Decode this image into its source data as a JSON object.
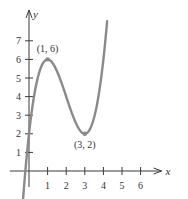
{
  "chart_data": {
    "type": "line",
    "title": "",
    "xlabel": "x",
    "ylabel": "y",
    "function": "y = x^3 - 6x^2 + 9x + 2",
    "xlim": [
      -0.6,
      6.7
    ],
    "ylim": [
      -0.8,
      7.7
    ],
    "x_ticks": [
      1,
      2,
      3,
      4,
      5,
      6
    ],
    "y_ticks": [
      1,
      2,
      3,
      4,
      5,
      6,
      7
    ],
    "x_tick_labels": [
      "1",
      "2",
      "3",
      "4",
      "5",
      "6"
    ],
    "y_tick_labels": [
      "1",
      "2",
      "3",
      "4",
      "5",
      "6",
      "7"
    ],
    "grid": false,
    "series": [
      {
        "name": "f(x)",
        "color": "#8a8a8a",
        "x": [
          -0.35,
          -0.2,
          0,
          0.25,
          0.5,
          0.75,
          1,
          1.25,
          1.5,
          1.75,
          2,
          2.25,
          2.5,
          2.75,
          3,
          3.25,
          3.5,
          3.75,
          4,
          4.2
        ],
        "y": [
          -1.96,
          0.03,
          2,
          3.77,
          5.13,
          5.83,
          6,
          5.83,
          5.38,
          4.73,
          4,
          3.27,
          2.63,
          2.17,
          2,
          2.2,
          2.88,
          4.11,
          6,
          7.97
        ]
      }
    ],
    "annotations": [
      {
        "text": "(1, 6)",
        "x": 1,
        "y": 6,
        "position": "above"
      },
      {
        "text": "(3, 2)",
        "x": 3,
        "y": 2,
        "position": "below"
      }
    ]
  }
}
